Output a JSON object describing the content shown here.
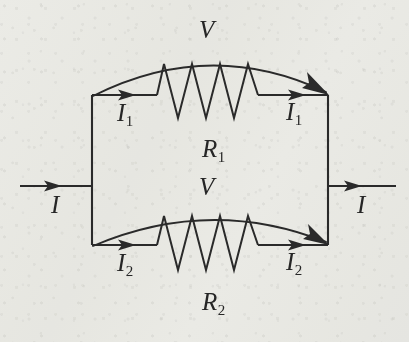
{
  "figure": {
    "name": "parallel-resistor-circuit",
    "background_color": "#f4f4f1",
    "ink_color": "#2a2a2a"
  },
  "labels": {
    "current_in": "I",
    "current_out": "I",
    "branch1_current_left": "I",
    "branch1_current_left_sub": "1",
    "branch1_current_right": "I",
    "branch1_current_right_sub": "1",
    "branch2_current_left": "I",
    "branch2_current_left_sub": "2",
    "branch2_current_right": "I",
    "branch2_current_right_sub": "2",
    "voltage_top": "V",
    "voltage_bottom": "V",
    "resistor1": "R",
    "resistor1_sub": "1",
    "resistor2": "R",
    "resistor2_sub": "2"
  },
  "circuit": {
    "type": "parallel",
    "branches": [
      {
        "name": "branch-1",
        "resistor": "R1",
        "current": "I1",
        "voltage": "V"
      },
      {
        "name": "branch-2",
        "resistor": "R2",
        "current": "I2",
        "voltage": "V"
      }
    ],
    "total_current": "I",
    "nodes": {
      "left_junction_x": 92,
      "right_junction_x": 328,
      "trunk_y": 186
    }
  }
}
